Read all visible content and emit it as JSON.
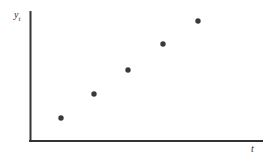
{
  "figure": {
    "background_color": "#ffffff",
    "width": 271,
    "height": 156
  },
  "axes": {
    "line_color": "#333333",
    "y_axis": {
      "x": 30,
      "y_top": 12,
      "y_bottom": 141,
      "width": 2
    },
    "x_axis": {
      "y": 141,
      "x_left": 30,
      "x_right": 262,
      "width": 2
    },
    "ylabel_main": "y",
    "ylabel_sub": "t",
    "xlabel": "t",
    "ticks": "none",
    "gridlines": "none"
  },
  "chart_data": {
    "type": "scatter",
    "title": "",
    "xlabel": "t",
    "ylabel": "y_t",
    "grid": false,
    "legend": "none",
    "marker_color": "#3a3a3a",
    "marker_size_px": 5,
    "x": [
      1,
      2,
      3,
      4,
      5
    ],
    "values": [
      1,
      2,
      3,
      4,
      5
    ],
    "series": [
      {
        "name": "y_t",
        "points_px": [
          {
            "x": 61,
            "y": 118
          },
          {
            "x": 94,
            "y": 94
          },
          {
            "x": 128,
            "y": 70
          },
          {
            "x": 163,
            "y": 44
          },
          {
            "x": 198,
            "y": 21
          }
        ]
      }
    ],
    "xlim": [
      0,
      6
    ],
    "ylim": [
      0,
      6
    ],
    "tick_labels_x": [],
    "tick_labels_y": []
  }
}
